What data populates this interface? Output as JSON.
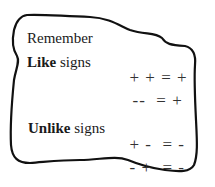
{
  "title": "Remember",
  "rules": [
    {
      "label_bold": "Like",
      "label_rest": " signs",
      "equations": [
        {
          "a": "+",
          "b": "+",
          "eq": "=",
          "result": "+"
        },
        {
          "a": "-",
          "b": "-",
          "eq": "=",
          "result": "+"
        }
      ]
    },
    {
      "label_bold": "Unlike",
      "label_rest": " signs",
      "equations": [
        {
          "a": "+",
          "b": "-",
          "eq": "=",
          "result": "-"
        },
        {
          "a": "-",
          "b": "+",
          "eq": "=",
          "result": "-"
        }
      ]
    }
  ]
}
